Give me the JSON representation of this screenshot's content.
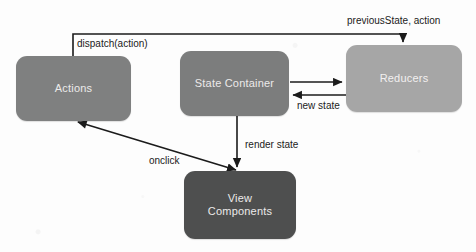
{
  "diagram": {
    "background_color": "#fdfdfd",
    "nodes": [
      {
        "id": "actions",
        "label": "Actions",
        "color": "#7f8080",
        "text_color": "#eceaea"
      },
      {
        "id": "state_container",
        "label": "State Container",
        "color": "#7c7d7d",
        "text_color": "#eceaea"
      },
      {
        "id": "reducers",
        "label": "Reducers",
        "color": "#a6a6a6",
        "text_color": "#f2f0f0"
      },
      {
        "id": "view_components",
        "label": "View\nComponents",
        "color": "#4e4f4f",
        "text_color": "#eceaea"
      }
    ],
    "edges": [
      {
        "id": "dispatch",
        "label": "dispatch(action)",
        "from": "actions",
        "to": "reducers",
        "style": "orthogonal",
        "arrows": "end"
      },
      {
        "id": "previous_state",
        "label": "previousState, action",
        "from": "actions",
        "to": "reducers",
        "style": "annotation",
        "arrows": "end"
      },
      {
        "id": "to_reducers",
        "label": "",
        "from": "state_container",
        "to": "reducers",
        "style": "straight",
        "arrows": "end"
      },
      {
        "id": "new_state",
        "label": "new state",
        "from": "reducers",
        "to": "state_container",
        "style": "straight",
        "arrows": "end"
      },
      {
        "id": "render_state",
        "label": "render state",
        "from": "state_container",
        "to": "view_components",
        "style": "straight",
        "arrows": "end"
      },
      {
        "id": "onclick",
        "label": "onclick",
        "from": "view_components",
        "to": "actions",
        "style": "diagonal",
        "arrows": "both"
      }
    ],
    "stroke_color": "#1b1b1b",
    "label_color": "#1b1b1b"
  }
}
